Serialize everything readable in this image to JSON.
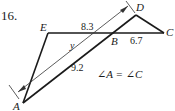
{
  "problem": {
    "number": "16.",
    "condition": "∠A = ∠C"
  },
  "figure": {
    "points": {
      "A": "A",
      "B": "B",
      "C": "C",
      "D": "D",
      "E": "E"
    },
    "measurements": {
      "EB": "8.3",
      "BC": "6.7",
      "AB": "9.2",
      "unknown": "y"
    },
    "colors": {
      "stroke": "#1a1a1a",
      "arrow": "#333333"
    }
  }
}
